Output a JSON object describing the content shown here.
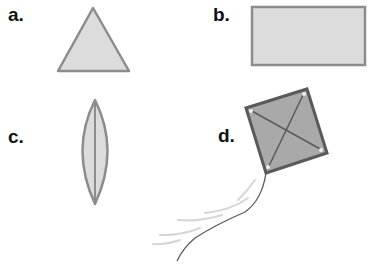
{
  "panels": [
    {
      "id": "a",
      "label": "a.",
      "shape": "triangle"
    },
    {
      "id": "b",
      "label": "b.",
      "shape": "rectangle"
    },
    {
      "id": "c",
      "label": "c.",
      "shape": "leaf-lens"
    },
    {
      "id": "d",
      "label": "d.",
      "shape": "kite"
    }
  ],
  "colors": {
    "fill_light": "#dcdcdc",
    "stroke": "#8c8c8c",
    "kite_fill": "#a9a9a9",
    "kite_stroke": "#5a5a5a",
    "tail_dark": "#555555",
    "tail_light": "#d0d0d0"
  }
}
